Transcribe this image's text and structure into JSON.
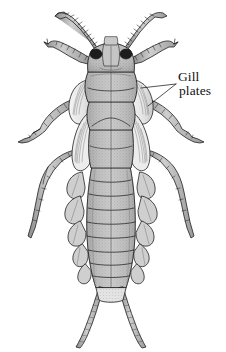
{
  "figure": {
    "view": "dorsal",
    "background_color": "#ffffff",
    "ink_color": "#1a1a1a",
    "body_fill": "#b4b4b4",
    "body_fill_light": "#d2d2d2",
    "gill_fill": "#efefef",
    "eye_color": "#1c1c1c"
  },
  "annotations": [
    {
      "id": "gill-plates",
      "line1": "Gill",
      "line2": "plates",
      "text": "Gill plates",
      "x": 178,
      "y": 70,
      "leader_apex": [
        176,
        84
      ],
      "leaders": [
        [
          [
            176,
            84
          ],
          [
            141,
            88
          ]
        ],
        [
          [
            176,
            84
          ],
          [
            148,
            106
          ]
        ]
      ]
    }
  ],
  "anatomy": {
    "parts": [
      "antenna-left",
      "antenna-right",
      "head",
      "compound-eye-left",
      "compound-eye-right",
      "pronotum",
      "mesothorax",
      "metathorax",
      "wing-pad-left",
      "wing-pad-right",
      "gill-plate-left",
      "gill-plate-right",
      "foreleg-left",
      "foreleg-right",
      "midleg-left",
      "midleg-right",
      "hindleg-left",
      "hindleg-right",
      "abdomen",
      "abdominal-gill-tufts",
      "cercus-left",
      "cercus-right"
    ],
    "abdominal_segments": 9,
    "cerci_count": 2,
    "legs_count": 6,
    "antennae_count": 2
  }
}
